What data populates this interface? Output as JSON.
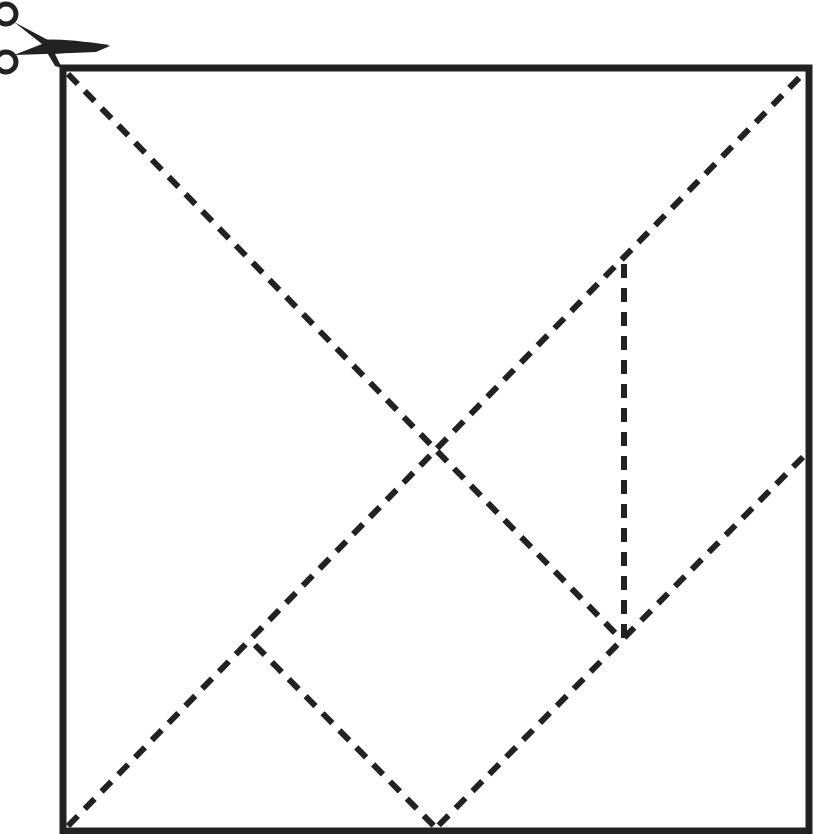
{
  "diagram": {
    "type": "tangram",
    "colors": {
      "line": "#222222",
      "background": "#ffffff"
    },
    "frame": {
      "x1": 63,
      "y1": 68,
      "x2": 809,
      "y2": 831,
      "stroke_width": 7
    },
    "cut_lines_dashed": [
      {
        "name": "main-diagonal-top-left-to-bottom-right-partial",
        "from": [
          66,
          72
        ],
        "to": [
          622,
          642
        ]
      },
      {
        "name": "main-diagonal-bottom-left-to-top-right",
        "from": [
          66,
          828
        ],
        "to": [
          805,
          72
        ]
      },
      {
        "name": "vertical-cut",
        "from": [
          624,
          263
        ],
        "to": [
          624,
          640
        ]
      },
      {
        "name": "right-mid-to-bottom-mid",
        "from": [
          805,
          455
        ],
        "to": [
          436,
          828
        ]
      },
      {
        "name": "left-quarter-to-bottom-mid",
        "from": [
          255,
          645
        ],
        "to": [
          436,
          828
        ]
      }
    ],
    "icons": [
      {
        "name": "scissors-icon",
        "position": "top-left corner"
      }
    ]
  }
}
